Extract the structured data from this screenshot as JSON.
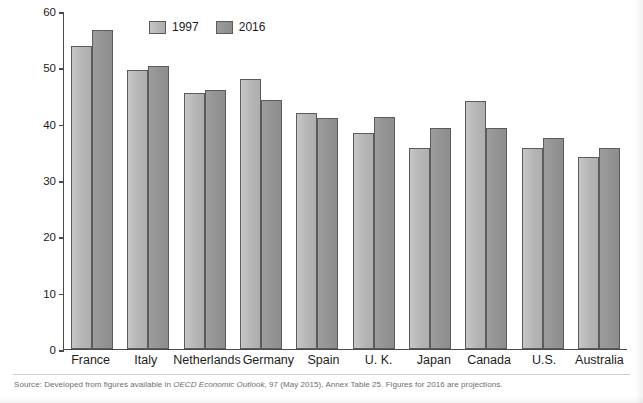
{
  "chart_data": {
    "type": "bar",
    "title": "",
    "categories": [
      "France",
      "Italy",
      "Netherlands",
      "Germany",
      "Spain",
      "U. K.",
      "Japan",
      "Canada",
      "U.S.",
      "Australia"
    ],
    "series": [
      {
        "name": "1997",
        "color": "#b6b6b6",
        "values": [
          53.8,
          49.5,
          45.5,
          47.9,
          41.9,
          38.4,
          35.7,
          44.0,
          35.7,
          34.1
        ]
      },
      {
        "name": "2016",
        "color": "#939393",
        "values": [
          56.6,
          50.2,
          45.9,
          44.2,
          41.0,
          41.2,
          39.3,
          39.3,
          37.5,
          35.7
        ]
      }
    ],
    "xlabel": "",
    "ylabel": "Government outlays (percentage of GDP)",
    "ylim": [
      0,
      60
    ],
    "yticks": [
      0,
      10,
      20,
      30,
      40,
      50,
      60
    ],
    "ytick_labels": [
      "0",
      "10",
      "20",
      "30",
      "40",
      "50",
      "60"
    ],
    "grid": false,
    "legend_position": "top-center"
  },
  "legend": {
    "items": [
      {
        "label": "1997",
        "swatch": "legend-swatch-1997"
      },
      {
        "label": "2016",
        "swatch": "legend-swatch-2016"
      }
    ]
  },
  "footer": {
    "source_prefix": "Source: Developed from figures available in ",
    "source_italic": "OECD Economic Outlook",
    "source_suffix": ", 97 (May 2015), Annex Table 25. Figures for 2016 are projections."
  },
  "top_clipped_text": {
    "text": "(clipped heading above figure)"
  }
}
